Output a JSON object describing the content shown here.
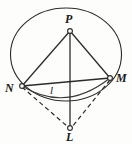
{
  "figure": {
    "type": "geometry-diagram",
    "stroke_color": "#2b2b2b",
    "background_color": "#fdfdfc",
    "vertices": [
      {
        "id": "P",
        "label": "P",
        "x": 70,
        "y": 31,
        "label_x": 65,
        "label_y": 14,
        "marker": "open-circle"
      },
      {
        "id": "N",
        "label": "N",
        "x": 22,
        "y": 86,
        "label_x": 5,
        "label_y": 83,
        "marker": "open-circle"
      },
      {
        "id": "M",
        "label": "M",
        "x": 110,
        "y": 78,
        "label_x": 116,
        "label_y": 73,
        "marker": "open-circle"
      },
      {
        "id": "L",
        "label": "L",
        "x": 70,
        "y": 128,
        "label_x": 65,
        "label_y": 132,
        "marker": "open-circle"
      }
    ],
    "segment_labels": [
      {
        "id": "l",
        "label": "l",
        "x": 50,
        "y": 85
      }
    ],
    "solid_edges": [
      "P-N",
      "P-M",
      "P-L",
      "N-M"
    ],
    "dashed_edges": [
      "N-L",
      "M-L"
    ],
    "arc": {
      "from": "N",
      "to": "M",
      "sag_y": 99
    },
    "ellipse": {
      "cx": 66,
      "cy": 54,
      "rx": 56,
      "ry": 46
    }
  }
}
